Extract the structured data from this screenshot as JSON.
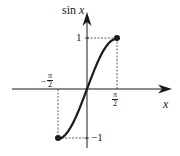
{
  "chart_data": {
    "type": "line",
    "title": "",
    "xlabel": "x",
    "ylabel": "sin x",
    "function": "sin(x)",
    "domain": [
      "-π/2",
      "π/2"
    ],
    "range": [
      -1,
      1
    ],
    "x_ticks": [
      {
        "value": -1.5708,
        "label_num": "π",
        "label_den": "2",
        "sign": "−"
      },
      {
        "value": 1.5708,
        "label_num": "π",
        "label_den": "2",
        "sign": ""
      }
    ],
    "y_ticks": [
      {
        "value": 1,
        "label": "1"
      },
      {
        "value": -1,
        "label": "−1"
      }
    ],
    "endpoints": [
      {
        "x": -1.5708,
        "y": -1,
        "marker": "filled-dot"
      },
      {
        "x": 1.5708,
        "y": 1,
        "marker": "filled-dot"
      }
    ],
    "series": [
      {
        "name": "sin x",
        "x": [
          -1.5708,
          -1.1781,
          -0.7854,
          -0.3927,
          0,
          0.3927,
          0.7854,
          1.1781,
          1.5708
        ],
        "values": [
          -1,
          -0.9239,
          -0.7071,
          -0.3827,
          0,
          0.3827,
          0.7071,
          0.9239,
          1
        ]
      }
    ],
    "guides": "dashed lines from endpoints to axes",
    "grid": false,
    "legend": null
  },
  "labels": {
    "ylabel_text": "sin ",
    "ylabel_var": "x",
    "xlabel": "x",
    "y_tick_pos": "1",
    "y_tick_neg": "−1",
    "x_tick_num": "π",
    "x_tick_den": "2",
    "x_tick_neg_sign": "−"
  },
  "colors": {
    "ink": "#1a1a1a",
    "background": "#ffffff"
  }
}
